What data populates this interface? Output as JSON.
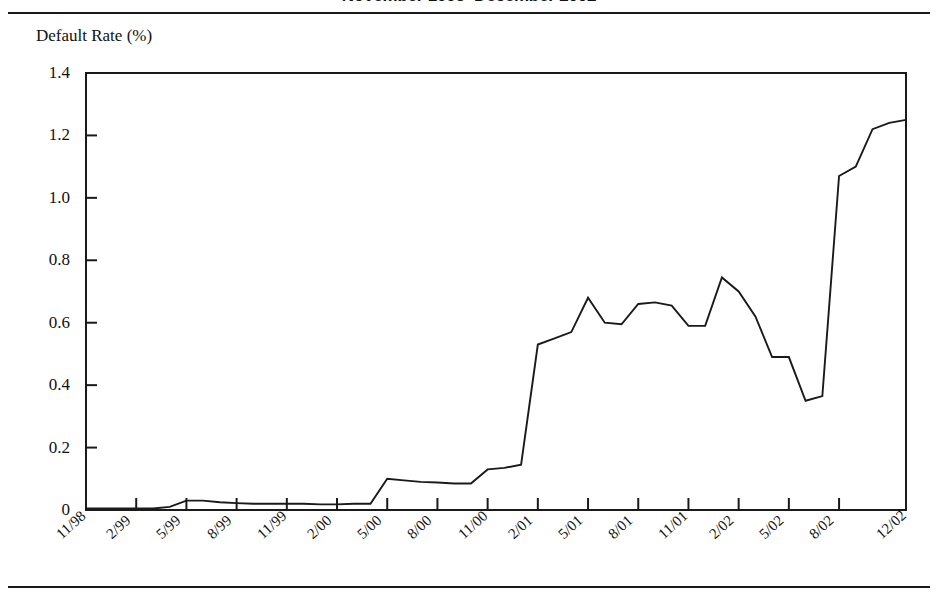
{
  "figure": {
    "title": "November 1998–December 2002",
    "axis_label_y": "Default Rate (%)"
  },
  "chart_data": {
    "type": "line",
    "title": "November 1998–December 2002",
    "xlabel": "",
    "ylabel": "Default Rate (%)",
    "ylim": [
      0,
      1.4
    ],
    "yticks": [
      "0",
      "0.2",
      "0.4",
      "0.6",
      "0.8",
      "1.0",
      "1.2",
      "1.4"
    ],
    "ytick_values": [
      0,
      0.2,
      0.4,
      0.6,
      0.8,
      1.0,
      1.2,
      1.4
    ],
    "xtick_labels": [
      "11/98",
      "2/99",
      "5/99",
      "8/99",
      "11/99",
      "2/00",
      "5/00",
      "8/00",
      "11/00",
      "2/01",
      "5/01",
      "8/01",
      "11/01",
      "2/02",
      "5/02",
      "8/02",
      "12/02"
    ],
    "grid": false,
    "legend": false,
    "line_color": "#1a1a1a",
    "series": [
      {
        "name": "Default Rate",
        "x": [
          "11/98",
          "12/98",
          "1/99",
          "2/99",
          "3/99",
          "4/99",
          "5/99",
          "6/99",
          "7/99",
          "8/99",
          "9/99",
          "10/99",
          "11/99",
          "12/99",
          "1/00",
          "2/00",
          "3/00",
          "4/00",
          "5/00",
          "6/00",
          "7/00",
          "8/00",
          "9/00",
          "10/00",
          "11/00",
          "12/00",
          "1/01",
          "2/01",
          "3/01",
          "4/01",
          "5/01",
          "6/01",
          "7/01",
          "8/01",
          "9/01",
          "10/01",
          "11/01",
          "12/01",
          "1/02",
          "2/02",
          "3/02",
          "4/02",
          "5/02",
          "6/02",
          "7/02",
          "8/02",
          "9/02",
          "10/02",
          "11/02",
          "12/02"
        ],
        "values": [
          0.005,
          0.005,
          0.005,
          0.005,
          0.005,
          0.01,
          0.03,
          0.03,
          0.025,
          0.022,
          0.02,
          0.02,
          0.02,
          0.02,
          0.018,
          0.018,
          0.02,
          0.02,
          0.1,
          0.095,
          0.09,
          0.088,
          0.085,
          0.085,
          0.13,
          0.135,
          0.145,
          0.53,
          0.55,
          0.57,
          0.68,
          0.6,
          0.595,
          0.66,
          0.665,
          0.655,
          0.59,
          0.59,
          0.745,
          0.7,
          0.62,
          0.49,
          0.49,
          0.35,
          0.365,
          1.07,
          1.1,
          1.22,
          1.24,
          1.25
        ]
      }
    ]
  }
}
